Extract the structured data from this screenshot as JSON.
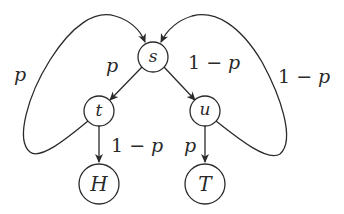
{
  "diagram": {
    "type": "state-transition-diagram",
    "colors": {
      "stroke": "#2a2a2a",
      "background": "#ffffff"
    },
    "nodes": [
      {
        "id": "s",
        "label": "s"
      },
      {
        "id": "t",
        "label": "t"
      },
      {
        "id": "u",
        "label": "u"
      },
      {
        "id": "H",
        "label": "H"
      },
      {
        "id": "T",
        "label": "T"
      }
    ],
    "edges": [
      {
        "from": "s",
        "to": "t",
        "label": "p"
      },
      {
        "from": "s",
        "to": "u",
        "label": "1 − p"
      },
      {
        "from": "t",
        "to": "H",
        "label": "1 − p"
      },
      {
        "from": "u",
        "to": "T",
        "label": "p"
      },
      {
        "from": "t",
        "to": "s",
        "label": "p"
      },
      {
        "from": "u",
        "to": "s",
        "label": "1 − p"
      }
    ],
    "labels": {
      "s_to_t": {
        "var": "p"
      },
      "s_to_u": {
        "num": "1",
        "op": " − ",
        "var": "p"
      },
      "t_to_H": {
        "num": "1",
        "op": " − ",
        "var": "p"
      },
      "u_to_T": {
        "var": "p"
      },
      "t_to_s": {
        "var": "p"
      },
      "u_to_s": {
        "num": "1",
        "op": " − ",
        "var": "p"
      }
    }
  }
}
